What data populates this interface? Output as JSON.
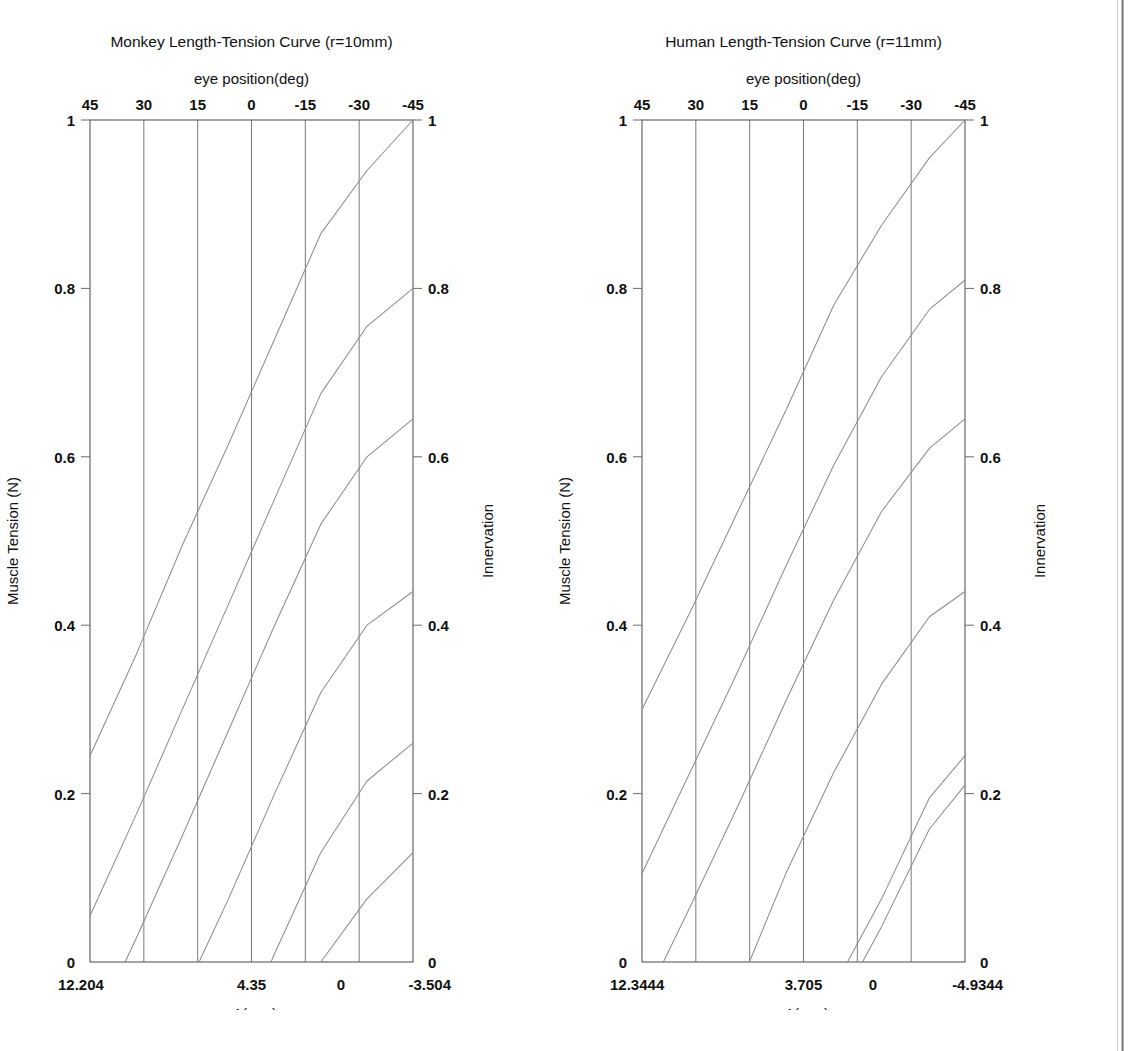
{
  "figure": {
    "background_color": "#ffffff",
    "curve_color": "#8e8e8e",
    "axis_color": "#5a5a5a"
  },
  "panels": [
    {
      "id": "monkey",
      "title": "Monkey Length-Tension Curve (r=10mm)",
      "top_axis_label": "eye position(deg)",
      "bottom_axis_label": "x1(mm)",
      "left_axis_label": "Muscle Tension (N)",
      "right_axis_label": "Innervation",
      "top_ticks": [
        "45",
        "30",
        "15",
        "0",
        "-15",
        "-30",
        "-45"
      ],
      "bottom_ticks": [
        {
          "text": "12.204",
          "pos": 0.0
        },
        {
          "text": "4.35",
          "pos": 0.5
        },
        {
          "text": "0",
          "pos": 0.777
        },
        {
          "text": "-3.504",
          "pos": 1.0
        }
      ],
      "left_ticks": [
        "1",
        "0.8",
        "0.6",
        "0.4",
        "0.2",
        "0"
      ],
      "right_ticks": [
        "1",
        "0.8",
        "0.6",
        "0.4",
        "0.2",
        "0"
      ],
      "corner_zero_left": "0",
      "corner_zero_right": "0"
    },
    {
      "id": "human",
      "title": "Human Length-Tension Curve (r=11mm)",
      "top_axis_label": "eye position(deg)",
      "bottom_axis_label": "x1(mm)",
      "left_axis_label": "Muscle Tension (N)",
      "right_axis_label": "Innervation",
      "top_ticks": [
        "45",
        "30",
        "15",
        "0",
        "-15",
        "-30",
        "-45"
      ],
      "bottom_ticks": [
        {
          "text": "12.3444",
          "pos": 0.0
        },
        {
          "text": "3.705",
          "pos": 0.5
        },
        {
          "text": "0",
          "pos": 0.715
        },
        {
          "text": "-4.9344",
          "pos": 1.0
        }
      ],
      "left_ticks": [
        "1",
        "0.8",
        "0.6",
        "0.4",
        "0.2",
        "0"
      ],
      "right_ticks": [
        "1",
        "0.8",
        "0.6",
        "0.4",
        "0.2",
        "0"
      ],
      "corner_zero_left": "0",
      "corner_zero_right": "0"
    }
  ],
  "chart_data": [
    {
      "type": "line",
      "panel_id": "monkey",
      "title": "Monkey Length-Tension Curve (r=10mm)",
      "xlabel": "x1(mm)",
      "ylabel": "Muscle Tension (N)",
      "secondary_xlabel": "eye position(deg)",
      "secondary_ylabel": "Innervation",
      "xlim": [
        12.204,
        -3.504
      ],
      "ylim": [
        0,
        1
      ],
      "grid": true,
      "legend": "none",
      "x_top_ticks": [
        45,
        30,
        15,
        0,
        -15,
        -30,
        -45
      ],
      "x_bottom_ticks": [
        12.204,
        4.35,
        0,
        -3.504
      ],
      "y_ticks": [
        0,
        0.2,
        0.4,
        0.6,
        0.8,
        1
      ],
      "series": [
        {
          "name": "innervation-1.00",
          "x": [
            12.204,
            9.959,
            7.714,
            5.469,
            3.224,
            0.979,
            -1.266,
            -3.504
          ],
          "y": [
            0.245,
            0.365,
            0.495,
            0.615,
            0.74,
            0.865,
            0.94,
            1.0
          ]
        },
        {
          "name": "innervation-0.80",
          "x": [
            12.204,
            9.959,
            7.714,
            5.469,
            3.224,
            0.979,
            -1.266,
            -3.504
          ],
          "y": [
            0.055,
            0.175,
            0.3,
            0.425,
            0.55,
            0.675,
            0.755,
            0.8
          ]
        },
        {
          "name": "innervation-0.64",
          "x": [
            10.5,
            9.959,
            7.714,
            5.469,
            3.224,
            0.979,
            -1.266,
            -3.504
          ],
          "y": [
            0.0,
            0.028,
            0.15,
            0.275,
            0.4,
            0.52,
            0.6,
            0.645
          ]
        },
        {
          "name": "innervation-0.44",
          "x": [
            6.9,
            5.469,
            3.224,
            0.979,
            -1.266,
            -3.504
          ],
          "y": [
            0.0,
            0.075,
            0.2,
            0.32,
            0.4,
            0.44
          ]
        },
        {
          "name": "innervation-0.26",
          "x": [
            3.4,
            3.224,
            0.979,
            -1.266,
            -3.504
          ],
          "y": [
            0.0,
            0.01,
            0.13,
            0.215,
            0.26
          ]
        },
        {
          "name": "innervation-0.13",
          "x": [
            0.6,
            0.979,
            -1.266,
            -3.504
          ],
          "y": [
            0.0,
            0.0,
            0.075,
            0.13
          ]
        }
      ]
    },
    {
      "type": "line",
      "panel_id": "human",
      "title": "Human Length-Tension Curve (r=11mm)",
      "xlabel": "x1(mm)",
      "ylabel": "Muscle Tension (N)",
      "secondary_xlabel": "eye position(deg)",
      "secondary_ylabel": "Innervation",
      "xlim": [
        12.3444,
        -4.9344
      ],
      "ylim": [
        0,
        1
      ],
      "grid": true,
      "legend": "none",
      "x_top_ticks": [
        45,
        30,
        15,
        0,
        -15,
        -30,
        -45
      ],
      "x_bottom_ticks": [
        12.3444,
        3.705,
        0,
        -4.9344
      ],
      "y_ticks": [
        0,
        0.2,
        0.4,
        0.6,
        0.8,
        1
      ],
      "series": [
        {
          "name": "innervation-1.00",
          "x": [
            12.3444,
            9.78,
            7.22,
            4.65,
            2.09,
            -0.47,
            -3.03,
            -4.9344
          ],
          "y": [
            0.3,
            0.415,
            0.535,
            0.655,
            0.78,
            0.875,
            0.955,
            1.0
          ]
        },
        {
          "name": "innervation-0.81",
          "x": [
            12.3444,
            9.78,
            7.22,
            4.65,
            2.09,
            -0.47,
            -3.03,
            -4.9344
          ],
          "y": [
            0.105,
            0.225,
            0.345,
            0.47,
            0.59,
            0.695,
            0.775,
            0.81
          ]
        },
        {
          "name": "innervation-0.645",
          "x": [
            11.2,
            9.78,
            7.22,
            4.65,
            2.09,
            -0.47,
            -3.03,
            -4.9344
          ],
          "y": [
            0.0,
            0.065,
            0.185,
            0.31,
            0.43,
            0.535,
            0.61,
            0.645
          ]
        },
        {
          "name": "innervation-0.44",
          "x": [
            6.6,
            4.65,
            2.09,
            -0.47,
            -3.03,
            -4.9344
          ],
          "y": [
            0.0,
            0.105,
            0.225,
            0.33,
            0.41,
            0.44
          ]
        },
        {
          "name": "innervation-0.245",
          "x": [
            1.35,
            -0.47,
            -3.03,
            -4.9344
          ],
          "y": [
            0.0,
            0.075,
            0.195,
            0.245
          ]
        },
        {
          "name": "innervation-0.21",
          "x": [
            0.55,
            -0.47,
            -3.03,
            -4.9344
          ],
          "y": [
            0.0,
            0.042,
            0.158,
            0.21
          ]
        }
      ]
    }
  ]
}
